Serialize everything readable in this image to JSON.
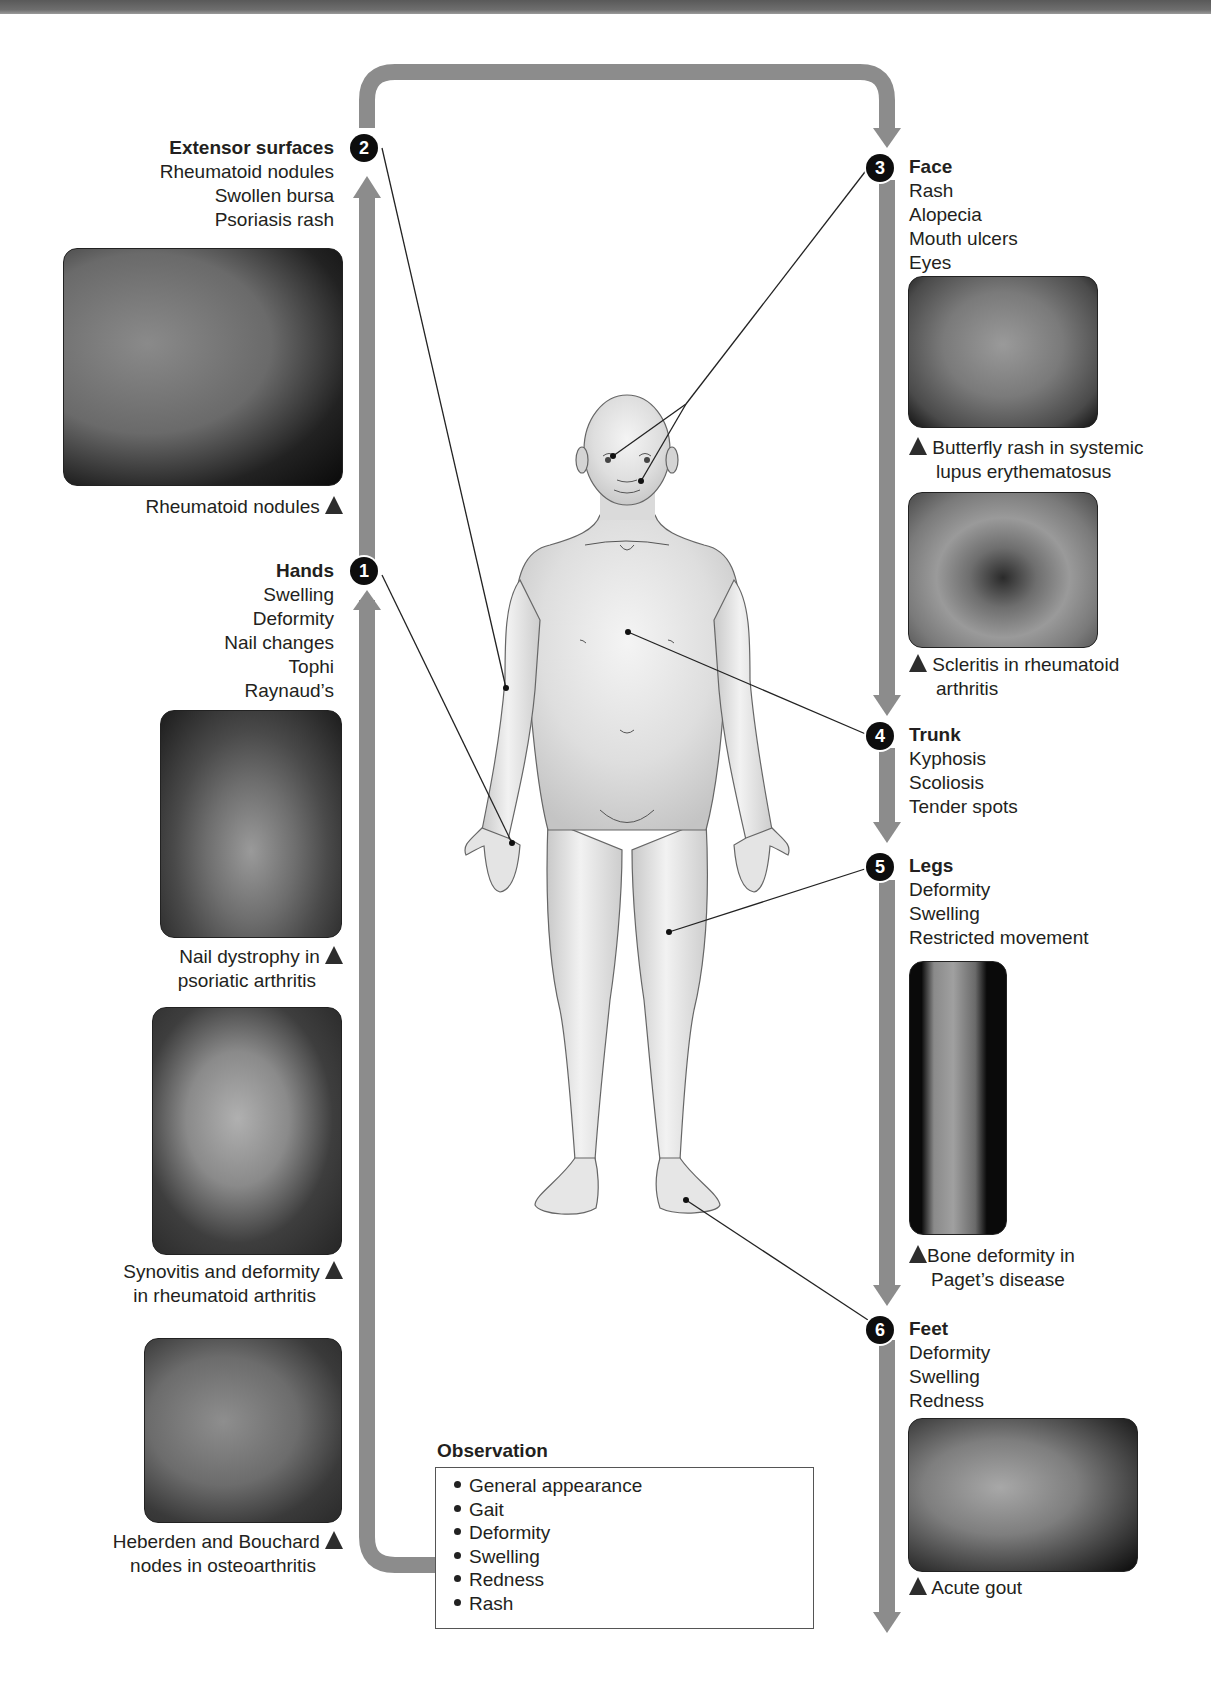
{
  "figure": {
    "flow_direction": "clockwise from Observation, up the left side, across the top, down the right side",
    "colors": {
      "arrow": "#8c8c8c",
      "badge": "#0d0d0d",
      "text": "#231f20",
      "body_fill": "#dcdcdc"
    }
  },
  "observation": {
    "title": "Observation",
    "items": [
      "General appearance",
      "Gait",
      "Deformity",
      "Swelling",
      "Redness",
      "Rash"
    ]
  },
  "steps": [
    {
      "number": "1",
      "title": "Hands",
      "items": [
        "Swelling",
        "Deformity",
        "Nail changes",
        "Tophi",
        "Raynaud’s"
      ]
    },
    {
      "number": "2",
      "title": "Extensor surfaces",
      "items": [
        "Rheumatoid nodules",
        "Swollen bursa",
        "Psoriasis rash"
      ]
    },
    {
      "number": "3",
      "title": "Face",
      "items": [
        "Rash",
        "Alopecia",
        "Mouth ulcers",
        "Eyes"
      ]
    },
    {
      "number": "4",
      "title": "Trunk",
      "items": [
        "Kyphosis",
        "Scoliosis",
        "Tender spots"
      ]
    },
    {
      "number": "5",
      "title": "Legs",
      "items": [
        "Deformity",
        "Swelling",
        "Restricted movement"
      ]
    },
    {
      "number": "6",
      "title": "Feet",
      "items": [
        "Deformity",
        "Swelling",
        "Redness"
      ]
    }
  ],
  "photos": {
    "rheumatoid_nodules": {
      "caption": [
        "Rheumatoid nodules"
      ]
    },
    "nail_dystrophy": {
      "caption": [
        "Nail dystrophy in",
        "psoriatic arthritis"
      ]
    },
    "synovitis": {
      "caption": [
        "Synovitis and deformity",
        "in rheumatoid arthritis"
      ]
    },
    "heberden": {
      "caption": [
        "Heberden and Bouchard",
        "nodes in osteoarthritis"
      ]
    },
    "butterfly_rash": {
      "caption": [
        "Butterfly rash in systemic",
        "lupus erythematosus"
      ]
    },
    "scleritis": {
      "caption": [
        "Scleritis in rheumatoid",
        "arthritis"
      ]
    },
    "paget": {
      "caption": [
        "Bone deformity in",
        "Paget’s disease"
      ]
    },
    "gout": {
      "caption": [
        "Acute gout"
      ]
    }
  }
}
